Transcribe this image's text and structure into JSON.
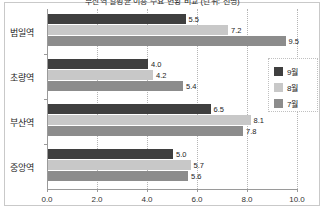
{
  "chart_data": {
    "type": "bar",
    "orientation": "horizontal",
    "title": "부산역 일평균 이용 수요 현황 비교 (단위: 천명)",
    "xlabel": "",
    "ylabel": "",
    "categories": [
      "범일역",
      "초량역",
      "부산역",
      "중앙역"
    ],
    "series": [
      {
        "name": "9월",
        "color": "#3f3f3f",
        "values": [
          5.5,
          4.0,
          6.5,
          5.0
        ]
      },
      {
        "name": "8월",
        "color": "#c8c8c8",
        "values": [
          7.2,
          4.2,
          8.1,
          5.7
        ]
      },
      {
        "name": "7월",
        "color": "#8c8c8c",
        "values": [
          9.5,
          5.4,
          7.8,
          5.6
        ]
      }
    ],
    "value_labels": {
      "범일역": [
        "5.5",
        "7.2",
        "9.5"
      ],
      "초량역": [
        "4.0",
        "4.2",
        "5.4"
      ],
      "부산역": [
        "6.5",
        "8.1",
        "7.8"
      ],
      "중앙역": [
        "5.0",
        "5.7",
        "5.6"
      ]
    },
    "xlim": [
      0.0,
      10.0
    ],
    "xticks": [
      0.0,
      2.0,
      4.0,
      6.0,
      8.0,
      10.0
    ],
    "xtick_labels": [
      "0.0",
      "2.0",
      "4.0",
      "6.0",
      "8.0",
      "10.0"
    ],
    "grid": true,
    "grid_style": "dotted-vertical",
    "legend_position": "right",
    "legend_entries": [
      "9월",
      "8월",
      "7월"
    ],
    "background_color": "#ffffff",
    "axis_color": "#9a9a9a"
  }
}
